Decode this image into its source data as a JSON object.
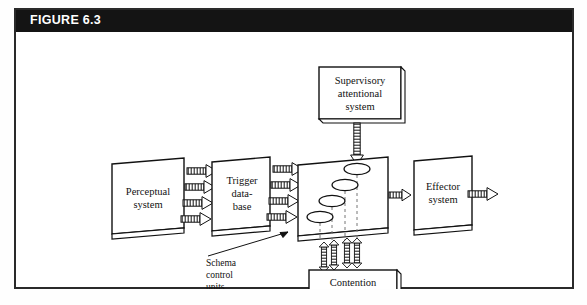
{
  "figure": {
    "title": "FIGURE 6.3",
    "title_bar_color": "#141414",
    "title_text_color": "#ffffff",
    "frame_border_color": "#2a2a2a",
    "background_color": "#ffffff",
    "line_color": "#111111"
  },
  "diagram": {
    "type": "flow-diagram",
    "nodes": [
      {
        "id": "perceptual",
        "label_lines": [
          "Perceptual",
          "system"
        ],
        "shape": "slab-3d"
      },
      {
        "id": "trigger",
        "label_lines": [
          "Trigger",
          "data-",
          "base"
        ],
        "shape": "slab-3d"
      },
      {
        "id": "schema",
        "label_lines": [],
        "shape": "slab-3d"
      },
      {
        "id": "effector",
        "label_lines": [
          "Effector",
          "system"
        ],
        "shape": "slab-3d"
      },
      {
        "id": "supervisory",
        "label_lines": [
          "Supervisory",
          "attentional",
          "system"
        ],
        "shape": "box-3d"
      },
      {
        "id": "contention",
        "label_lines": [
          "Contention",
          "scheduling"
        ],
        "shape": "box-3d"
      }
    ],
    "annotations": [
      {
        "id": "schema-control-units",
        "label_lines": [
          "Schema",
          "control",
          "units"
        ],
        "leader": true
      }
    ],
    "edges": [
      {
        "from": "perceptual",
        "to": "trigger",
        "count": 4,
        "style": "hatched-arrow",
        "direction": "right"
      },
      {
        "from": "trigger",
        "to": "schema",
        "count": 4,
        "style": "hatched-arrow",
        "direction": "right"
      },
      {
        "from": "schema",
        "to": "effector",
        "count": 1,
        "style": "hatched-arrow",
        "direction": "right"
      },
      {
        "from": "effector",
        "to": "output",
        "count": 1,
        "style": "hatched-arrow",
        "direction": "right"
      },
      {
        "from": "supervisory",
        "to": "schema",
        "count": 1,
        "style": "hatched-arrow",
        "direction": "down"
      },
      {
        "from": "schema",
        "to": "contention",
        "count": 4,
        "style": "hatched-arrow",
        "direction": "bidirectional-vertical"
      }
    ],
    "schema_units": {
      "count": 4,
      "shape": "ellipse",
      "dashed_drop_lines": true
    }
  }
}
